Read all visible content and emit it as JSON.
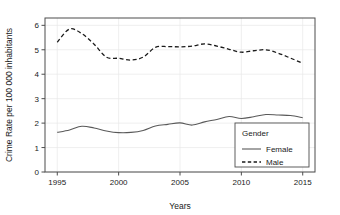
{
  "chart_data": {
    "type": "line",
    "title": "",
    "subtitle": "",
    "xlabel": "Years",
    "ylabel": "Crime Rate per 100 000 inhabitants",
    "xlim": [
      1994.0,
      2016.0
    ],
    "ylim": [
      0,
      6.3
    ],
    "xticks": [
      1995,
      2000,
      2005,
      2010,
      2015
    ],
    "xtick_labels": [
      "1995",
      "2000",
      "2005",
      "2010",
      "2015"
    ],
    "yticks": [
      0,
      1,
      2,
      3,
      4,
      5,
      6
    ],
    "ytick_labels": [
      "0",
      "1",
      "2",
      "3",
      "4",
      "5",
      "6"
    ],
    "grid": true,
    "grid_color": "#e8e8e8",
    "panel_border_color": "#4d4d4d",
    "legend": {
      "title": "Gender",
      "position": "bottom-right-inside",
      "entries": [
        {
          "name": "Female",
          "style": "solid",
          "color": "#595959"
        },
        {
          "name": "Male",
          "style": "dashed",
          "color": "#1a1a1a"
        }
      ]
    },
    "x": [
      1995,
      1996,
      1997,
      1998,
      1999,
      2000,
      2001,
      2002,
      2003,
      2004,
      2005,
      2006,
      2007,
      2008,
      2009,
      2010,
      2011,
      2012,
      2013,
      2014,
      2015
    ],
    "series": [
      {
        "name": "Female",
        "style": "solid",
        "color": "#595959",
        "values": [
          1.62,
          1.72,
          1.87,
          1.8,
          1.68,
          1.61,
          1.62,
          1.7,
          1.88,
          1.95,
          2.01,
          1.92,
          2.05,
          2.15,
          2.27,
          2.19,
          2.26,
          2.35,
          2.33,
          2.31,
          2.22
        ]
      },
      {
        "name": "Male",
        "style": "dashed",
        "color": "#1a1a1a",
        "values": [
          5.31,
          5.85,
          5.66,
          5.23,
          4.7,
          4.65,
          4.58,
          4.7,
          5.1,
          5.13,
          5.12,
          5.15,
          5.24,
          5.15,
          5.02,
          4.9,
          4.96,
          5.0,
          4.86,
          4.66,
          4.45
        ]
      }
    ]
  }
}
